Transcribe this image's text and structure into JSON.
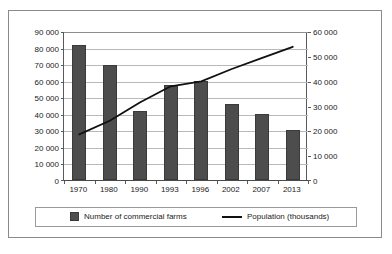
{
  "chart_data": {
    "type": "bar",
    "title": "",
    "xlabel": "",
    "categories": [
      "1970",
      "1980",
      "1990",
      "1993",
      "1996",
      "2002",
      "2007",
      "2013"
    ],
    "series": [
      {
        "name": "Number of commercial farms",
        "type": "bar",
        "axis": "left",
        "color": "#4d4d4d",
        "values": [
          82000,
          70000,
          42000,
          57500,
          60500,
          46500,
          40000,
          30500
        ]
      },
      {
        "name": "Population (thousands)",
        "type": "line",
        "axis": "right",
        "color": "#111111",
        "values": [
          18500,
          24000,
          31500,
          38000,
          40000,
          45000,
          49500,
          54000
        ]
      }
    ],
    "left_axis": {
      "ylabel": "",
      "ylim": [
        0,
        90000
      ],
      "tick_step": 10000,
      "ticks": [
        "0",
        "10 000",
        "20 000",
        "30 000",
        "40 000",
        "50 000",
        "60 000",
        "70 000",
        "80 000",
        "90 000"
      ]
    },
    "right_axis": {
      "ylabel": "",
      "ylim": [
        0,
        60000
      ],
      "tick_step": 10000,
      "ticks": [
        "0",
        "10 000",
        "20 000",
        "30 000",
        "40 000",
        "50 000",
        "60 000"
      ]
    },
    "grid": true,
    "legend_position": "bottom",
    "legend": [
      {
        "label": "Number of commercial farms",
        "marker": "bar-swatch"
      },
      {
        "label": "Population (thousands)",
        "marker": "line-swatch"
      }
    ]
  }
}
